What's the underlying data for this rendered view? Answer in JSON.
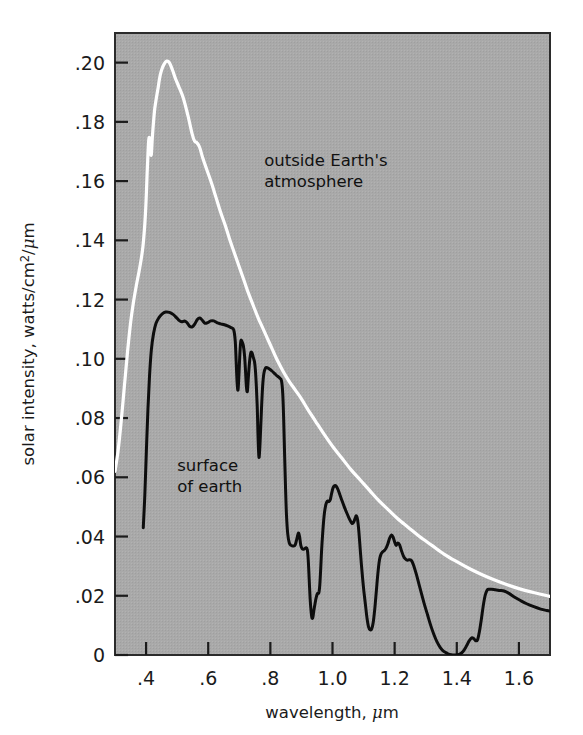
{
  "figure": {
    "background_color": "#ffffff",
    "plot_background_color": "#a9a9a9",
    "frame_color": "#2b2b2b",
    "tick_color": "#1b1b1b"
  },
  "chart_data": {
    "type": "line",
    "title": "",
    "xlabel": "wavelength, μm",
    "ylabel": "solar intensity, watts/cm²/μm",
    "xlim": [
      0.3,
      1.7
    ],
    "ylim": [
      0.0,
      0.21
    ],
    "grid": false,
    "legend_position": "inline-annotations",
    "xticks": [
      0.4,
      0.6,
      0.8,
      1.0,
      1.2,
      1.4,
      1.6
    ],
    "xtick_labels": [
      ".4",
      ".6",
      ".8",
      "1.0",
      "1.2",
      "1.4",
      "1.6"
    ],
    "yticks": [
      0,
      0.02,
      0.04,
      0.06,
      0.08,
      0.1,
      0.12,
      0.14,
      0.16,
      0.18,
      0.2
    ],
    "ytick_labels": [
      "0",
      ".02",
      ".04",
      ".06",
      ".08",
      ".10",
      ".12",
      ".14",
      ".16",
      ".18",
      ".20"
    ],
    "annotations": [
      {
        "id": "outside-earths-atmosphere",
        "lines": [
          "outside Earth's",
          "atmosphere"
        ],
        "x": 0.78,
        "y": 0.165,
        "color": "#111111"
      },
      {
        "id": "surface-of-earth",
        "lines": [
          "surface",
          "of earth"
        ],
        "x": 0.5,
        "y": 0.062,
        "color": "#111111"
      }
    ],
    "series": [
      {
        "name": "outside Earth's atmosphere",
        "color": "#ffffff",
        "line_width": 3.2,
        "points": [
          [
            0.3,
            0.062
          ],
          [
            0.31,
            0.069
          ],
          [
            0.32,
            0.079
          ],
          [
            0.33,
            0.0905
          ],
          [
            0.34,
            0.102
          ],
          [
            0.35,
            0.112
          ],
          [
            0.36,
            0.1195
          ],
          [
            0.37,
            0.1255
          ],
          [
            0.38,
            0.131
          ],
          [
            0.39,
            0.138
          ],
          [
            0.398,
            0.149
          ],
          [
            0.404,
            0.164
          ],
          [
            0.408,
            0.173
          ],
          [
            0.411,
            0.1745
          ],
          [
            0.414,
            0.17
          ],
          [
            0.417,
            0.169
          ],
          [
            0.42,
            0.1745
          ],
          [
            0.424,
            0.18
          ],
          [
            0.428,
            0.1845
          ],
          [
            0.433,
            0.188
          ],
          [
            0.438,
            0.191
          ],
          [
            0.444,
            0.195
          ],
          [
            0.45,
            0.1975
          ],
          [
            0.458,
            0.1995
          ],
          [
            0.466,
            0.2005
          ],
          [
            0.475,
            0.2
          ],
          [
            0.485,
            0.1975
          ],
          [
            0.495,
            0.1945
          ],
          [
            0.505,
            0.192
          ],
          [
            0.52,
            0.188
          ],
          [
            0.535,
            0.182
          ],
          [
            0.548,
            0.176
          ],
          [
            0.556,
            0.1735
          ],
          [
            0.563,
            0.173
          ],
          [
            0.572,
            0.1715
          ],
          [
            0.582,
            0.168
          ],
          [
            0.595,
            0.164
          ],
          [
            0.61,
            0.1595
          ],
          [
            0.625,
            0.1545
          ],
          [
            0.64,
            0.1495
          ],
          [
            0.655,
            0.145
          ],
          [
            0.67,
            0.14
          ],
          [
            0.685,
            0.1355
          ],
          [
            0.7,
            0.131
          ],
          [
            0.715,
            0.1265
          ],
          [
            0.73,
            0.122
          ],
          [
            0.745,
            0.118
          ],
          [
            0.76,
            0.114
          ],
          [
            0.775,
            0.1105
          ],
          [
            0.79,
            0.107
          ],
          [
            0.805,
            0.1035
          ],
          [
            0.82,
            0.1
          ],
          [
            0.84,
            0.096
          ],
          [
            0.86,
            0.0925
          ],
          [
            0.88,
            0.0895
          ],
          [
            0.9,
            0.0865
          ],
          [
            0.92,
            0.083
          ],
          [
            0.945,
            0.079
          ],
          [
            0.97,
            0.075
          ],
          [
            1.0,
            0.0705
          ],
          [
            1.03,
            0.0665
          ],
          [
            1.06,
            0.0625
          ],
          [
            1.09,
            0.059
          ],
          [
            1.12,
            0.0555
          ],
          [
            1.15,
            0.052
          ],
          [
            1.18,
            0.049
          ],
          [
            1.21,
            0.046
          ],
          [
            1.245,
            0.043
          ],
          [
            1.28,
            0.04
          ],
          [
            1.32,
            0.037
          ],
          [
            1.36,
            0.034
          ],
          [
            1.4,
            0.0315
          ],
          [
            1.44,
            0.0292
          ],
          [
            1.48,
            0.0272
          ],
          [
            1.52,
            0.0254
          ],
          [
            1.56,
            0.0238
          ],
          [
            1.6,
            0.0224
          ],
          [
            1.65,
            0.021
          ],
          [
            1.7,
            0.0198
          ]
        ]
      },
      {
        "name": "surface of earth",
        "color": "#0d0d0d",
        "line_width": 3.0,
        "points": [
          [
            0.391,
            0.043
          ],
          [
            0.396,
            0.054
          ],
          [
            0.401,
            0.069
          ],
          [
            0.406,
            0.083
          ],
          [
            0.411,
            0.094
          ],
          [
            0.417,
            0.103
          ],
          [
            0.424,
            0.1085
          ],
          [
            0.432,
            0.112
          ],
          [
            0.442,
            0.114
          ],
          [
            0.452,
            0.1152
          ],
          [
            0.463,
            0.1158
          ],
          [
            0.475,
            0.1157
          ],
          [
            0.487,
            0.115
          ],
          [
            0.497,
            0.114
          ],
          [
            0.506,
            0.113
          ],
          [
            0.515,
            0.1125
          ],
          [
            0.524,
            0.1128
          ],
          [
            0.532,
            0.1122
          ],
          [
            0.54,
            0.111
          ],
          [
            0.549,
            0.1108
          ],
          [
            0.557,
            0.1118
          ],
          [
            0.565,
            0.1133
          ],
          [
            0.573,
            0.1138
          ],
          [
            0.581,
            0.113
          ],
          [
            0.59,
            0.112
          ],
          [
            0.598,
            0.1122
          ],
          [
            0.608,
            0.1128
          ],
          [
            0.618,
            0.1128
          ],
          [
            0.628,
            0.1122
          ],
          [
            0.64,
            0.1118
          ],
          [
            0.652,
            0.1115
          ],
          [
            0.664,
            0.111
          ],
          [
            0.674,
            0.1105
          ],
          [
            0.682,
            0.1098
          ],
          [
            0.687,
            0.106
          ],
          [
            0.69,
            0.099
          ],
          [
            0.693,
            0.092
          ],
          [
            0.696,
            0.0895
          ],
          [
            0.699,
            0.095
          ],
          [
            0.702,
            0.102
          ],
          [
            0.705,
            0.106
          ],
          [
            0.709,
            0.1058
          ],
          [
            0.713,
            0.1045
          ],
          [
            0.717,
            0.101
          ],
          [
            0.72,
            0.096
          ],
          [
            0.723,
            0.0905
          ],
          [
            0.726,
            0.089
          ],
          [
            0.729,
            0.0935
          ],
          [
            0.733,
            0.099
          ],
          [
            0.737,
            0.102
          ],
          [
            0.741,
            0.102
          ],
          [
            0.745,
            0.1005
          ],
          [
            0.749,
            0.099
          ],
          [
            0.752,
            0.096
          ],
          [
            0.755,
            0.0905
          ],
          [
            0.758,
            0.083
          ],
          [
            0.76,
            0.075
          ],
          [
            0.762,
            0.069
          ],
          [
            0.764,
            0.0668
          ],
          [
            0.767,
            0.072
          ],
          [
            0.771,
            0.082
          ],
          [
            0.775,
            0.0905
          ],
          [
            0.779,
            0.095
          ],
          [
            0.784,
            0.0968
          ],
          [
            0.79,
            0.097
          ],
          [
            0.798,
            0.0965
          ],
          [
            0.806,
            0.0958
          ],
          [
            0.814,
            0.095
          ],
          [
            0.822,
            0.0942
          ],
          [
            0.83,
            0.0935
          ],
          [
            0.836,
            0.0925
          ],
          [
            0.84,
            0.088
          ],
          [
            0.843,
            0.079
          ],
          [
            0.846,
            0.067
          ],
          [
            0.849,
            0.056
          ],
          [
            0.852,
            0.047
          ],
          [
            0.856,
            0.0408
          ],
          [
            0.861,
            0.0378
          ],
          [
            0.867,
            0.037
          ],
          [
            0.874,
            0.0368
          ],
          [
            0.88,
            0.0372
          ],
          [
            0.886,
            0.0395
          ],
          [
            0.89,
            0.0412
          ],
          [
            0.894,
            0.04
          ],
          [
            0.898,
            0.037
          ],
          [
            0.903,
            0.0358
          ],
          [
            0.909,
            0.0358
          ],
          [
            0.915,
            0.0362
          ],
          [
            0.919,
            0.0355
          ],
          [
            0.922,
            0.032
          ],
          [
            0.925,
            0.0255
          ],
          [
            0.928,
            0.019
          ],
          [
            0.931,
            0.0148
          ],
          [
            0.934,
            0.0125
          ],
          [
            0.937,
            0.0128
          ],
          [
            0.94,
            0.015
          ],
          [
            0.944,
            0.0175
          ],
          [
            0.948,
            0.0196
          ],
          [
            0.952,
            0.0208
          ],
          [
            0.956,
            0.021
          ],
          [
            0.959,
            0.0235
          ],
          [
            0.962,
            0.029
          ],
          [
            0.965,
            0.0355
          ],
          [
            0.969,
            0.042
          ],
          [
            0.973,
            0.047
          ],
          [
            0.977,
            0.05
          ],
          [
            0.981,
            0.0515
          ],
          [
            0.985,
            0.052
          ],
          [
            0.989,
            0.0518
          ],
          [
            0.993,
            0.0525
          ],
          [
            0.997,
            0.0545
          ],
          [
            1.002,
            0.0565
          ],
          [
            1.007,
            0.0572
          ],
          [
            1.012,
            0.057
          ],
          [
            1.018,
            0.0558
          ],
          [
            1.024,
            0.054
          ],
          [
            1.031,
            0.052
          ],
          [
            1.038,
            0.05
          ],
          [
            1.045,
            0.0482
          ],
          [
            1.052,
            0.0465
          ],
          [
            1.058,
            0.0452
          ],
          [
            1.063,
            0.0444
          ],
          [
            1.068,
            0.0448
          ],
          [
            1.073,
            0.0462
          ],
          [
            1.077,
            0.047
          ],
          [
            1.081,
            0.0455
          ],
          [
            1.085,
            0.0415
          ],
          [
            1.089,
            0.036
          ],
          [
            1.093,
            0.0305
          ],
          [
            1.097,
            0.0258
          ],
          [
            1.101,
            0.0215
          ],
          [
            1.106,
            0.017
          ],
          [
            1.111,
            0.0125
          ],
          [
            1.116,
            0.0095
          ],
          [
            1.121,
            0.0085
          ],
          [
            1.126,
            0.0088
          ],
          [
            1.131,
            0.011
          ],
          [
            1.136,
            0.0155
          ],
          [
            1.141,
            0.0215
          ],
          [
            1.146,
            0.0275
          ],
          [
            1.151,
            0.032
          ],
          [
            1.156,
            0.034
          ],
          [
            1.161,
            0.0348
          ],
          [
            1.166,
            0.0352
          ],
          [
            1.172,
            0.036
          ],
          [
            1.178,
            0.0375
          ],
          [
            1.184,
            0.0395
          ],
          [
            1.19,
            0.0405
          ],
          [
            1.195,
            0.0398
          ],
          [
            1.2,
            0.0382
          ],
          [
            1.205,
            0.037
          ],
          [
            1.21,
            0.0378
          ],
          [
            1.216,
            0.0372
          ],
          [
            1.222,
            0.0352
          ],
          [
            1.228,
            0.0335
          ],
          [
            1.234,
            0.0325
          ],
          [
            1.241,
            0.032
          ],
          [
            1.248,
            0.0322
          ],
          [
            1.255,
            0.0318
          ],
          [
            1.262,
            0.03
          ],
          [
            1.27,
            0.0272
          ],
          [
            1.278,
            0.024
          ],
          [
            1.287,
            0.0205
          ],
          [
            1.296,
            0.017
          ],
          [
            1.306,
            0.0135
          ],
          [
            1.316,
            0.01
          ],
          [
            1.326,
            0.007
          ],
          [
            1.336,
            0.0045
          ],
          [
            1.347,
            0.0025
          ],
          [
            1.358,
            0.0012
          ],
          [
            1.37,
            0.0005
          ],
          [
            1.382,
            0.0001
          ],
          [
            1.395,
            0.0
          ],
          [
            1.408,
            0.0002
          ],
          [
            1.42,
            0.0012
          ],
          [
            1.431,
            0.003
          ],
          [
            1.44,
            0.0048
          ],
          [
            1.448,
            0.0058
          ],
          [
            1.455,
            0.0055
          ],
          [
            1.461,
            0.0048
          ],
          [
            1.467,
            0.0052
          ],
          [
            1.473,
            0.008
          ],
          [
            1.479,
            0.012
          ],
          [
            1.485,
            0.0165
          ],
          [
            1.491,
            0.02
          ],
          [
            1.497,
            0.0218
          ],
          [
            1.503,
            0.0222
          ],
          [
            1.512,
            0.0222
          ],
          [
            1.524,
            0.022
          ],
          [
            1.538,
            0.0218
          ],
          [
            1.552,
            0.0216
          ],
          [
            1.568,
            0.0208
          ],
          [
            1.585,
            0.0196
          ],
          [
            1.605,
            0.0184
          ],
          [
            1.625,
            0.0173
          ],
          [
            1.648,
            0.0163
          ],
          [
            1.67,
            0.0155
          ],
          [
            1.69,
            0.015
          ],
          [
            1.7,
            0.0148
          ]
        ]
      }
    ]
  }
}
